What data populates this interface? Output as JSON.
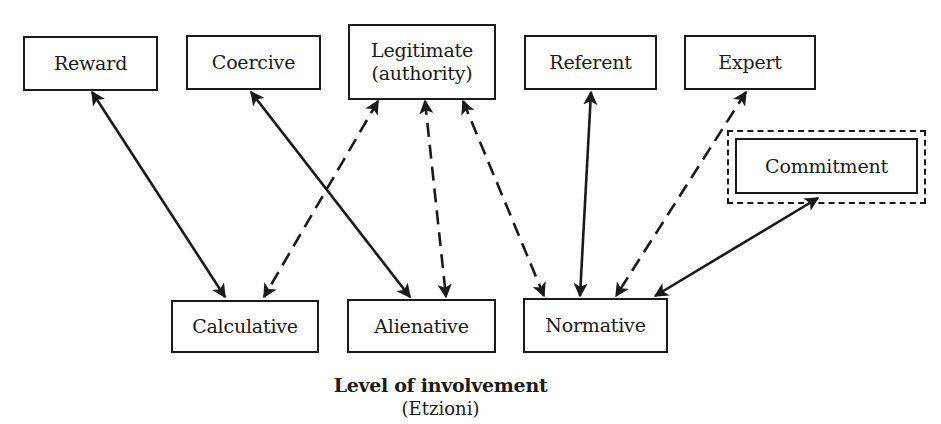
{
  "diagram": {
    "power_bases": [
      {
        "id": "reward",
        "label": "Reward",
        "x": 23,
        "y": 36,
        "w": 135,
        "h": 55
      },
      {
        "id": "coercive",
        "label": "Coercive",
        "x": 186,
        "y": 35,
        "w": 135,
        "h": 55
      },
      {
        "id": "legitimate",
        "label": "Legitimate\n(authority)",
        "x": 348,
        "y": 24,
        "w": 148,
        "h": 76
      },
      {
        "id": "referent",
        "label": "Referent",
        "x": 524,
        "y": 35,
        "w": 133,
        "h": 55
      },
      {
        "id": "expert",
        "label": "Expert",
        "x": 684,
        "y": 35,
        "w": 132,
        "h": 55
      }
    ],
    "commitment": {
      "id": "commitment",
      "label": "Commitment",
      "x": 735,
      "y": 138,
      "w": 183,
      "h": 56,
      "outer": {
        "x": 727,
        "y": 130,
        "w": 199,
        "h": 74
      }
    },
    "involvement_levels": [
      {
        "id": "calculative",
        "label": "Calculative",
        "x": 171,
        "y": 300,
        "w": 148,
        "h": 53
      },
      {
        "id": "alienative",
        "label": "Alienative",
        "x": 347,
        "y": 299,
        "w": 149,
        "h": 54
      },
      {
        "id": "normative",
        "label": "Normative",
        "x": 523,
        "y": 298,
        "w": 145,
        "h": 55
      }
    ],
    "edges": [
      {
        "from": "reward",
        "to": "calculative",
        "style": "solid",
        "x1": 92,
        "y1": 92,
        "x2": 225,
        "y2": 297
      },
      {
        "from": "coercive",
        "to": "alienative",
        "style": "solid",
        "x1": 251,
        "y1": 92,
        "x2": 410,
        "y2": 297
      },
      {
        "from": "legitimate",
        "to": "calculative",
        "style": "dashed",
        "x1": 378,
        "y1": 101,
        "x2": 264,
        "y2": 297
      },
      {
        "from": "legitimate",
        "to": "alienative",
        "style": "dashed",
        "x1": 425,
        "y1": 101,
        "x2": 446,
        "y2": 297
      },
      {
        "from": "legitimate",
        "to": "normative",
        "style": "dashed",
        "x1": 463,
        "y1": 101,
        "x2": 544,
        "y2": 296
      },
      {
        "from": "referent",
        "to": "normative",
        "style": "solid",
        "x1": 591,
        "y1": 92,
        "x2": 580,
        "y2": 296
      },
      {
        "from": "expert",
        "to": "normative",
        "style": "dashed",
        "x1": 746,
        "y1": 92,
        "x2": 616,
        "y2": 296
      },
      {
        "from": "commitment",
        "to": "normative",
        "style": "solid",
        "x1": 818,
        "y1": 198,
        "x2": 655,
        "y2": 296
      }
    ],
    "caption": {
      "title": "Level of involvement",
      "source": "(Etzioni)"
    },
    "colors": {
      "ink": "#1a1a1a",
      "background": "#ffffff"
    }
  }
}
